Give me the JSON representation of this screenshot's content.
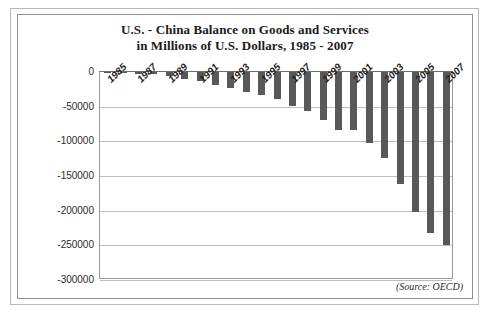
{
  "chart_data": {
    "type": "bar",
    "title": "U.S. - China Balance on Goods and Services in Millions of U.S. Dollars, 1985 - 2007",
    "title_line1": "U.S. - China Balance on Goods and Services",
    "title_line2": "in Millions of U.S. Dollars, 1985 - 2007",
    "xlabel": "",
    "ylabel": "",
    "ylim": [
      -300000,
      0
    ],
    "grid": true,
    "legend": null,
    "orientation": "vertical",
    "bar_color": "#595959",
    "annotation": "(Source: OECD)",
    "categories": [
      "1985",
      "1986",
      "1987",
      "1988",
      "1989",
      "1990",
      "1991",
      "1992",
      "1993",
      "1994",
      "1995",
      "1996",
      "1997",
      "1998",
      "1999",
      "2000",
      "2001",
      "2002",
      "2003",
      "2004",
      "2005",
      "2006",
      "2007"
    ],
    "values": [
      -600,
      -1700,
      -2800,
      -3500,
      -6200,
      -10400,
      -12700,
      -18300,
      -22800,
      -29500,
      -33800,
      -39500,
      -49700,
      -56900,
      -68700,
      -83800,
      -83100,
      -103100,
      -124000,
      -162000,
      -202000,
      -232000,
      -250000
    ],
    "x_tick_labels": [
      "1985",
      "1987",
      "1989",
      "1991",
      "1993",
      "1995",
      "1997",
      "1999",
      "2001",
      "2003",
      "2005",
      "2007"
    ],
    "x_tick_indices": [
      0,
      2,
      4,
      6,
      8,
      10,
      12,
      14,
      16,
      18,
      20,
      22
    ],
    "y_tick_labels": [
      "0",
      "-50000",
      "-100000",
      "-150000",
      "-200000",
      "-250000",
      "-300000"
    ],
    "y_tick_values": [
      0,
      -50000,
      -100000,
      -150000,
      -200000,
      -250000,
      -300000
    ]
  }
}
